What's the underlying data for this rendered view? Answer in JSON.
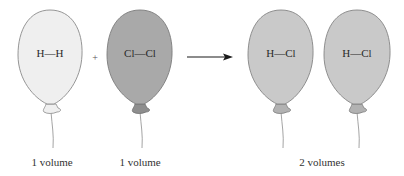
{
  "diagram": {
    "operator_plus": "+",
    "arrow": "reaction-arrow",
    "balloons": [
      {
        "formula": "H—H",
        "fill": "#efefef",
        "stroke": "#8a8a8a",
        "cx": 50,
        "label_group": 0
      },
      {
        "formula": "Cl—Cl",
        "fill": "#a9a9a9",
        "stroke": "#7c7c7c",
        "cx": 140,
        "label_group": 1
      },
      {
        "formula": "H—Cl",
        "fill": "#c9c9c9",
        "stroke": "#848484",
        "cx": 281,
        "label_group": 2
      },
      {
        "formula": "H—Cl",
        "fill": "#c9c9c9",
        "stroke": "#848484",
        "cx": 358,
        "label_group": 2
      }
    ],
    "labels": [
      {
        "text": "1 volume",
        "x": 52
      },
      {
        "text": "1 volume",
        "x": 140
      },
      {
        "text": "2 volumes",
        "x": 322
      }
    ]
  }
}
